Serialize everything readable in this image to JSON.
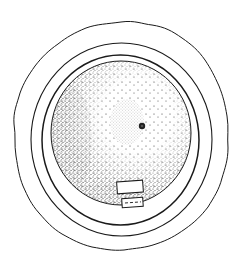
{
  "figure": {
    "type": "stippled scientific illustration",
    "colors": {
      "background": "#ffffff",
      "ink": "#1a1a1a",
      "stipple": "#333333"
    },
    "parts": [
      {
        "name": "outer-wavy-envelope",
        "cx": 121,
        "cy": 136,
        "rx": 107,
        "ry": 114
      },
      {
        "name": "outer-ring",
        "cx": 121,
        "cy": 139,
        "rx": 90,
        "ry": 96
      },
      {
        "name": "inner-ring",
        "cx": 121,
        "cy": 140,
        "rx": 79,
        "ry": 85
      },
      {
        "name": "stippled-disc",
        "cx": 121,
        "cy": 133,
        "rx": 70,
        "ry": 72
      },
      {
        "name": "oval-body",
        "cx": 127,
        "cy": 122,
        "rx": 17,
        "ry": 23
      },
      {
        "name": "dark-dot",
        "cx": 142,
        "cy": 126,
        "r": 3
      },
      {
        "name": "upper-rectangle",
        "x": 117,
        "y": 181,
        "w": 26,
        "h": 12
      },
      {
        "name": "lower-rectangle-dashed",
        "x": 122,
        "y": 198,
        "w": 21,
        "h": 9
      }
    ]
  }
}
